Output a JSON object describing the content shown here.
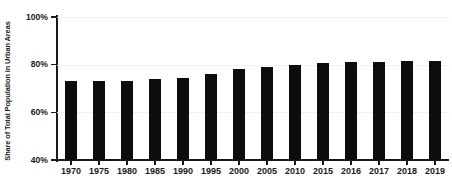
{
  "chart_data": {
    "type": "bar",
    "title": "",
    "xlabel": "",
    "ylabel": "Share of Total Population in Urban Areas",
    "ylim": [
      40,
      100
    ],
    "ytick_labels": [
      "40%",
      "60%",
      "80%",
      "100%"
    ],
    "ytick_values": [
      40,
      60,
      80,
      100
    ],
    "grid": true,
    "grid_axis": "y",
    "legend": "none",
    "bar_color": "#0d0d0d",
    "axis_color": "#1a1a1a",
    "gridline_color": "#f0f0f0",
    "background": "#ffffff",
    "categories": [
      "1970",
      "1975",
      "1980",
      "1985",
      "1990",
      "1995",
      "2000",
      "2005",
      "2010",
      "2015",
      "2016",
      "2017",
      "2018",
      "2019"
    ],
    "values": [
      73.0,
      73.0,
      73.3,
      73.8,
      74.5,
      76.2,
      78.1,
      79.2,
      79.7,
      80.7,
      81.0,
      81.2,
      81.4,
      81.6
    ],
    "value_unit": "%",
    "value_labels": [
      "73.0%",
      "73.0%",
      "73.3%",
      "73.8%",
      "74.5%",
      "76.2%",
      "78.1%",
      "79.2%",
      "79.7%",
      "80.7%",
      "81.0%",
      "81.2%",
      "81.4%",
      "81.6%"
    ]
  }
}
